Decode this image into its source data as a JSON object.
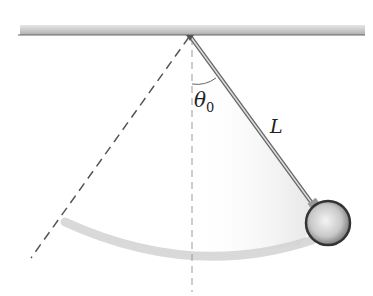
{
  "diagram": {
    "labels": {
      "angle_symbol": "θ",
      "angle_subscript": "0",
      "length": "L"
    },
    "colors": {
      "ceiling": "#8a8a8a",
      "dashed": "#555555",
      "rod": "#777777",
      "arc": "#d6d6d6",
      "bob": "#9a9a9a"
    }
  }
}
